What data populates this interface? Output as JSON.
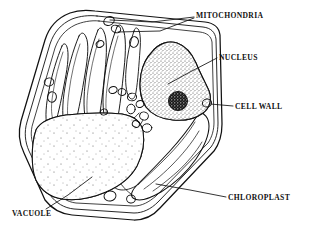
{
  "figure": {
    "background_color": "#ffffff",
    "ink_color": "#111111",
    "width": 311,
    "height": 245,
    "style": "black-and-white line drawing with stipple shading"
  },
  "labels": {
    "mitochondria": "MITOCHONDRIA",
    "nucleus": "NUCLEUS",
    "cell_wall": "CELL WALL",
    "chloroplast": "CHLOROPLAST",
    "vacuole": "VACUOLE"
  },
  "structures": [
    {
      "name": "cell-wall",
      "label": "CELL WALL",
      "description": "multi-layered outer boundary enclosing the whole cell",
      "label_position": "right"
    },
    {
      "name": "nucleus",
      "label": "NUCLEUS",
      "description": "large stippled rounded body in the upper right interior containing a dark nucleolus",
      "label_position": "upper-right"
    },
    {
      "name": "nucleolus",
      "label": "",
      "description": "dense dark circular body inside the nucleus",
      "label_position": "none"
    },
    {
      "name": "mitochondria",
      "label": "MITOCHONDRIA",
      "description": "small oval organelles scattered along the cell periphery and clustered beside the nucleus",
      "label_position": "top-right"
    },
    {
      "name": "chloroplast",
      "label": "CHLOROPLAST",
      "description": "elongated lens-shaped plastids with internal lamellae, grouped along the upper left wall and one large one at lower right",
      "label_position": "lower-right"
    },
    {
      "name": "vacuole",
      "label": "VACUOLE",
      "description": "large sparsely stippled region filling the lower left of the cell",
      "label_position": "lower-left"
    }
  ],
  "leader_lines": [
    {
      "from": "MITOCHONDRIA",
      "to": "mitochondria-top",
      "count": 2
    },
    {
      "from": "NUCLEUS",
      "to": "nucleus",
      "count": 1
    },
    {
      "from": "CELL WALL",
      "to": "cell-wall-right-edge",
      "count": 1
    },
    {
      "from": "CHLOROPLAST",
      "to": "chloroplast-lower-right",
      "count": 1
    },
    {
      "from": "VACUOLE",
      "to": "vacuole",
      "count": 1
    }
  ]
}
